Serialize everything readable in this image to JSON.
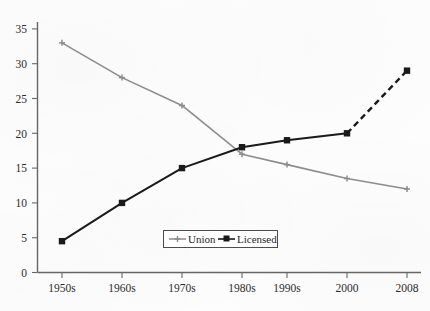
{
  "chart_data": {
    "type": "line",
    "title": "",
    "xlabel": "",
    "ylabel": "",
    "categories": [
      "1950s",
      "1960s",
      "1970s",
      "1980s",
      "1990s",
      "2000",
      "2008"
    ],
    "ylim": [
      0,
      35
    ],
    "ytick_step": 5,
    "yticks": [
      "0",
      "5",
      "10",
      "15",
      "20",
      "25",
      "30",
      "35"
    ],
    "grid": false,
    "legend_position": "inside-bottom-center",
    "series": [
      {
        "name": "Union",
        "color": "#8c8c8c",
        "marker": "cross",
        "linestyle": "solid",
        "values": [
          33,
          28,
          24,
          17,
          15.5,
          13.5,
          12
        ]
      },
      {
        "name": "Licensed",
        "color": "#1a1a1a",
        "marker": "square",
        "linestyle": "solid",
        "dashed_from_index": 5,
        "values": [
          4.5,
          10,
          15,
          18,
          19,
          20,
          29
        ]
      }
    ]
  },
  "legend": {
    "entries": [
      {
        "label": "Union"
      },
      {
        "label": "Licensed"
      }
    ]
  },
  "axes": {
    "y_tick_labels": [
      "35",
      "30",
      "25",
      "20",
      "15",
      "10",
      "5",
      "0"
    ],
    "x_tick_labels": [
      "1950s",
      "1960s",
      "1970s",
      "1980s",
      "1990s",
      "2000",
      "2008"
    ]
  },
  "colors": {
    "union": "#8c8c8c",
    "licensed": "#1a1a1a",
    "axis": "#555555",
    "background": "#fdfdfd"
  }
}
